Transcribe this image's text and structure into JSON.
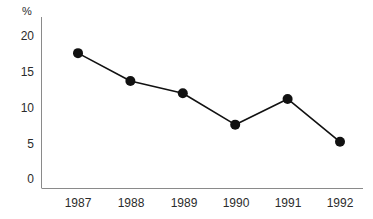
{
  "chart_data": {
    "type": "line",
    "title": "",
    "subtitle": "",
    "xlabel": "",
    "ylabel": "%",
    "categories": [
      "1987",
      "1988",
      "1989",
      "1990",
      "1991",
      "1992"
    ],
    "x": [
      1987,
      1988,
      1989,
      1990,
      1991,
      1992
    ],
    "values": [
      17.6,
      13.7,
      12.0,
      7.6,
      11.2,
      5.2
    ],
    "series": [
      {
        "name": "",
        "values": [
          17.6,
          13.7,
          12.0,
          7.6,
          11.2,
          5.2
        ]
      }
    ],
    "ylim": [
      0,
      21.5
    ],
    "yticks": [
      0,
      5,
      10,
      15,
      20
    ],
    "ytick_labels": [
      "0",
      "5",
      "10",
      "15",
      "20"
    ],
    "grid": false,
    "legend": "none",
    "marker": "filled-circle",
    "line_color": "#111111",
    "marker_color": "#111111",
    "axis_color": "#8a8a8a",
    "background": "#ffffff"
  },
  "axes": {
    "unit_label": "%",
    "y_ticks": [
      {
        "label": "20",
        "value": 20
      },
      {
        "label": "15",
        "value": 15
      },
      {
        "label": "10",
        "value": 10
      },
      {
        "label": "5",
        "value": 5
      },
      {
        "label": "0",
        "value": 0
      }
    ],
    "x_ticks": [
      {
        "label": "1987"
      },
      {
        "label": "1988"
      },
      {
        "label": "1989"
      },
      {
        "label": "1990"
      },
      {
        "label": "1991"
      },
      {
        "label": "1992"
      }
    ]
  }
}
